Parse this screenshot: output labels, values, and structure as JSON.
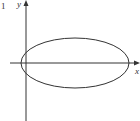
{
  "figure": {
    "corner_mark": "1",
    "x_axis_label": "x",
    "y_axis_label": "y",
    "colors": {
      "stroke": "#333333",
      "background": "#ffffff"
    },
    "ellipse": {
      "cx": 75,
      "cy": 63,
      "rx": 54,
      "ry": 25
    },
    "axes": {
      "origin_x": 26,
      "origin_y": 63
    }
  }
}
